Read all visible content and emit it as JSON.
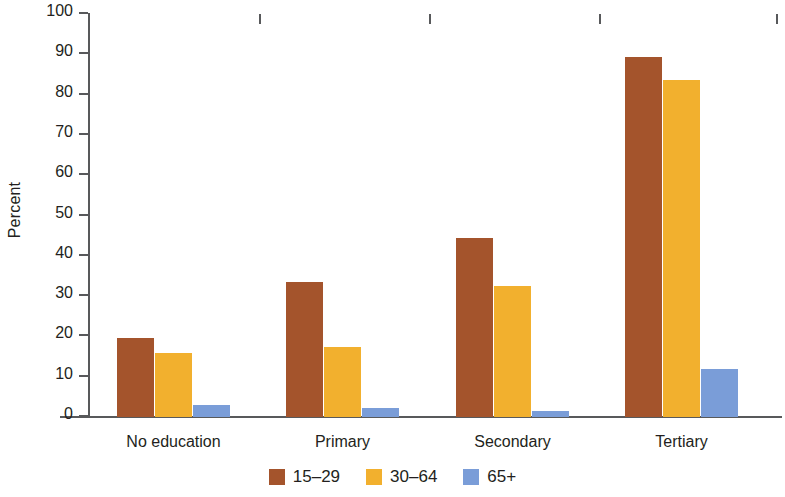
{
  "chart_data": {
    "type": "bar",
    "title": "",
    "subtitle": "",
    "xlabel": "",
    "ylabel": "Percent",
    "ylim": [
      0,
      100
    ],
    "ytick_step": 10,
    "yticks": [
      0,
      10,
      20,
      30,
      40,
      50,
      60,
      70,
      80,
      90,
      100
    ],
    "ytick_labels": [
      "0",
      "10",
      "20",
      "30",
      "40",
      "50",
      "60",
      "70",
      "80",
      "90",
      "100"
    ],
    "grid": false,
    "legend_position": "bottom-center",
    "orientation": "vertical",
    "grouping": "grouped",
    "categories": [
      "No education",
      "Primary",
      "Secondary",
      "Tertiary"
    ],
    "series": [
      {
        "name": "15–29",
        "color": "#A4542C",
        "values": [
          19.5,
          33.5,
          44.3,
          89.4
        ]
      },
      {
        "name": "30–64",
        "color": "#F2B02E",
        "values": [
          15.8,
          17.4,
          32.6,
          83.7
        ]
      },
      {
        "name": "65+",
        "color": "#7A9DD8",
        "values": [
          3.0,
          2.2,
          1.5,
          11.8
        ]
      }
    ],
    "axis_color": "#58595b",
    "text_color": "#231f20",
    "background_color": "#ffffff"
  }
}
